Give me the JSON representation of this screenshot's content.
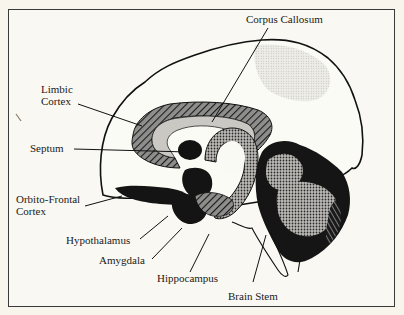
{
  "diagram": {
    "colors": {
      "background": "#f7f5ec",
      "frame": "#3a3a3a",
      "ink": "#111111",
      "cortex_fill": "#fbfbf6",
      "light_stipple": "#dedcd4",
      "mid_gray": "#9a9a98",
      "dark": "#151515"
    },
    "labels": {
      "corpus_callosum": "Corpus Callosum",
      "limbic_cortex": "Limbic\nCortex",
      "septum": "Septum",
      "orbito_frontal_cortex": "Orbito-Frontal\nCortex",
      "hypothalamus": "Hypothalamus",
      "amygdala": "Amygdala",
      "hippocampus": "Hippocampus",
      "brain_stem": "Brain Stem"
    }
  }
}
